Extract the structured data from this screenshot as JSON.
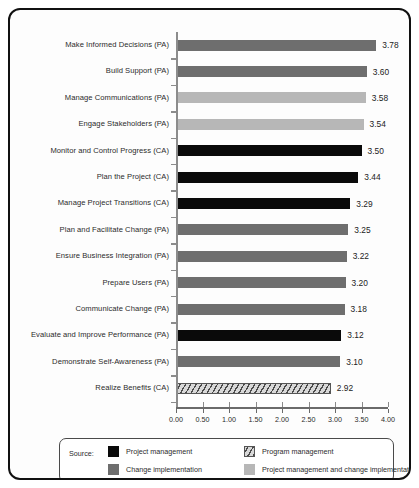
{
  "legend": {
    "source_label": "Source:",
    "entries": [
      {
        "key": "project-management",
        "label": "Project management",
        "fill": "fill-pm",
        "color": "#0a0a0a"
      },
      {
        "key": "program-management",
        "label": "Program management",
        "fill": "fill-prog",
        "color": "#d8d8d8"
      },
      {
        "key": "change-implementation",
        "label": "Change implementation",
        "fill": "fill-ci",
        "color": "#6e6e6e"
      },
      {
        "key": "project-management-and-change-implementation",
        "label": "Project management and change implementation",
        "fill": "fill-pmci",
        "color": "#b7b7b7"
      }
    ]
  },
  "chart_data": {
    "type": "bar",
    "orientation": "horizontal",
    "title": "",
    "subtitle": "",
    "xlabel": "",
    "ylabel": "",
    "xlim": [
      0,
      4
    ],
    "grid": false,
    "legend_position": "bottom",
    "xticks": [
      "0.00",
      "0.50",
      "1.00",
      "1.50",
      "2.00",
      "2.50",
      "3.00",
      "3.50",
      "4.00"
    ],
    "xtick_values": [
      0,
      0.5,
      1,
      1.5,
      2,
      2.5,
      3,
      3.5,
      4
    ],
    "categories": [
      "Make Informed Decisions (PA)",
      "Build Support (PA)",
      "Manage Communications (PA)",
      "Engage Stakeholders (PA)",
      "Monitor and Control Progress (CA)",
      "Plan the Project (CA)",
      "Manage Project Transitions (CA)",
      "Plan and Facilitate Change (PA)",
      "Ensure Business Integration (PA)",
      "Prepare Users (PA)",
      "Communicate Change (PA)",
      "Evaluate and Improve Performance (PA)",
      "Demonstrate Self-Awareness (PA)",
      "Realize Benefits (CA)"
    ],
    "values": [
      3.78,
      3.6,
      3.58,
      3.54,
      3.5,
      3.44,
      3.29,
      3.25,
      3.22,
      3.2,
      3.18,
      3.12,
      3.1,
      2.92
    ],
    "value_labels": [
      "3.78",
      "3.60",
      "3.58",
      "3.54",
      "3.50",
      "3.44",
      "3.29",
      "3.25",
      "3.22",
      "3.20",
      "3.18",
      "3.12",
      "3.10",
      "2.92"
    ],
    "series_keys": [
      "change-implementation",
      "change-implementation",
      "project-management-and-change-implementation",
      "project-management-and-change-implementation",
      "project-management",
      "project-management",
      "project-management",
      "change-implementation",
      "change-implementation",
      "change-implementation",
      "change-implementation",
      "project-management",
      "change-implementation",
      "program-management"
    ]
  }
}
